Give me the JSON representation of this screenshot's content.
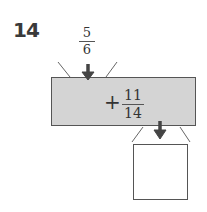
{
  "problem": {
    "number": "14",
    "input": {
      "numerator": "5",
      "denominator": "6"
    },
    "operation": {
      "operator": "+",
      "numerator": "11",
      "denominator": "14"
    },
    "output": {
      "value": ""
    }
  },
  "colors": {
    "box_fill": "#d4d4d4",
    "arrow": "#444444",
    "stroke": "#555555"
  }
}
